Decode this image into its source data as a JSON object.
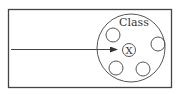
{
  "diagram": {
    "class_label": "Class",
    "center_label": "X",
    "stroke_color": "#444444",
    "background": "#ffffff"
  }
}
